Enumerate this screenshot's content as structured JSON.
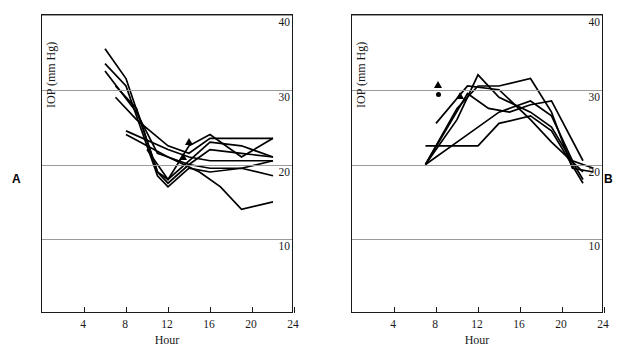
{
  "figure": {
    "panels": [
      {
        "letter": "A",
        "xaxis": {
          "title": "Hour",
          "ticks": [
            4,
            8,
            12,
            16,
            20,
            24
          ],
          "min": 0,
          "max": 24
        },
        "yaxis": {
          "title": "IOP (mm Hg)",
          "ticks": [
            40,
            30,
            20,
            10
          ],
          "min": 0,
          "max": 40
        }
      },
      {
        "letter": "B",
        "xaxis": {
          "title": "Hour",
          "ticks": [
            4,
            8,
            12,
            16,
            20,
            24
          ],
          "min": 0,
          "max": 24
        },
        "yaxis": {
          "title": "IOP (mm Hg)",
          "ticks": [
            40,
            30,
            20,
            10
          ],
          "min": 0,
          "max": 40
        }
      }
    ]
  },
  "chart_data": [
    {
      "type": "line",
      "panel": "A",
      "title": "",
      "xlabel": "Hour",
      "ylabel": "IOP (mm Hg)",
      "xlim": [
        0,
        24
      ],
      "ylim": [
        0,
        40
      ],
      "xticks": [
        4,
        8,
        12,
        16,
        20,
        24
      ],
      "yticks": [
        10,
        20,
        30,
        40
      ],
      "yticks_side": "right",
      "grid": "horizontal",
      "legend": "none",
      "series": [
        {
          "name": "subject-1",
          "x": [
            6,
            8,
            11,
            12,
            14,
            16,
            19,
            22
          ],
          "y": [
            35.5,
            31.5,
            19.0,
            17.5,
            20.0,
            22.0,
            21.5,
            21.0
          ]
        },
        {
          "name": "subject-2",
          "x": [
            6,
            8,
            11,
            12,
            14,
            16,
            19,
            22
          ],
          "y": [
            33.5,
            30.5,
            18.5,
            17.0,
            19.5,
            19.0,
            19.5,
            18.5
          ]
        },
        {
          "name": "subject-3",
          "x": [
            6,
            9,
            11,
            12,
            14,
            16,
            19,
            22
          ],
          "y": [
            32.5,
            27.0,
            21.5,
            21.0,
            20.0,
            19.5,
            19.5,
            20.5
          ]
        },
        {
          "name": "subject-4",
          "x": [
            7,
            9,
            11,
            12,
            14,
            16,
            19,
            22
          ],
          "y": [
            30.5,
            27.5,
            19.0,
            18.0,
            22.5,
            24.0,
            21.0,
            23.5
          ]
        },
        {
          "name": "subject-5",
          "x": [
            7,
            9,
            12,
            14,
            16,
            19,
            22
          ],
          "y": [
            29.0,
            26.0,
            22.5,
            21.5,
            23.5,
            23.5,
            23.5
          ]
        },
        {
          "name": "subject-6",
          "x": [
            8,
            12,
            14,
            16,
            19,
            22
          ],
          "y": [
            24.5,
            22.0,
            21.0,
            20.5,
            20.5,
            20.5
          ]
        },
        {
          "name": "subject-7",
          "x": [
            8,
            12,
            15,
            17,
            19,
            22
          ],
          "y": [
            24.0,
            21.0,
            19.0,
            17.0,
            14.0,
            15.0
          ]
        },
        {
          "name": "subject-8",
          "x": [
            10,
            12,
            14,
            16,
            19,
            22
          ],
          "y": [
            22.0,
            18.0,
            20.5,
            23.0,
            22.5,
            21.0
          ]
        }
      ],
      "markers": [
        {
          "shape": "triangle",
          "x": 14.0,
          "y": 23.0
        },
        {
          "shape": "triangle",
          "x": 13.5,
          "y": 21.0
        }
      ]
    },
    {
      "type": "line",
      "panel": "B",
      "title": "",
      "xlabel": "Hour",
      "ylabel": "IOP (mm Hg)",
      "xlim": [
        0,
        24
      ],
      "ylim": [
        0,
        40
      ],
      "xticks": [
        4,
        8,
        12,
        16,
        20,
        24
      ],
      "yticks": [
        10,
        20,
        30,
        40
      ],
      "yticks_side": "right",
      "grid": "horizontal",
      "legend": "none",
      "series": [
        {
          "name": "subject-1",
          "x": [
            7,
            10,
            12,
            14,
            17,
            19,
            22
          ],
          "y": [
            20.0,
            26.0,
            32.0,
            29.0,
            27.0,
            25.0,
            18.0
          ]
        },
        {
          "name": "subject-2",
          "x": [
            7,
            10,
            12,
            14,
            17,
            19,
            21,
            23
          ],
          "y": [
            20.0,
            27.5,
            30.5,
            30.5,
            31.5,
            27.0,
            19.5,
            19.0
          ]
        },
        {
          "name": "subject-3",
          "x": [
            7,
            11,
            13,
            15,
            17,
            19,
            22
          ],
          "y": [
            20.0,
            29.5,
            27.5,
            27.0,
            28.0,
            28.5,
            20.5
          ]
        },
        {
          "name": "subject-4",
          "x": [
            7,
            11,
            14,
            17,
            19,
            21,
            23
          ],
          "y": [
            20.0,
            24.0,
            27.0,
            28.5,
            26.5,
            20.5,
            19.5
          ]
        },
        {
          "name": "subject-5",
          "x": [
            7,
            12,
            14,
            17,
            19,
            22
          ],
          "y": [
            22.5,
            22.5,
            25.5,
            26.5,
            24.5,
            17.5
          ]
        },
        {
          "name": "subject-6",
          "x": [
            8,
            11,
            14,
            17,
            19,
            22
          ],
          "y": [
            25.5,
            30.5,
            30.0,
            26.0,
            23.0,
            19.0
          ]
        }
      ],
      "markers": [
        {
          "shape": "triangle",
          "x": 8.2,
          "y": 30.7
        },
        {
          "shape": "circle",
          "x": 8.2,
          "y": 29.3
        },
        {
          "shape": "triangle",
          "x": 10.3,
          "y": 29.2
        }
      ]
    }
  ]
}
